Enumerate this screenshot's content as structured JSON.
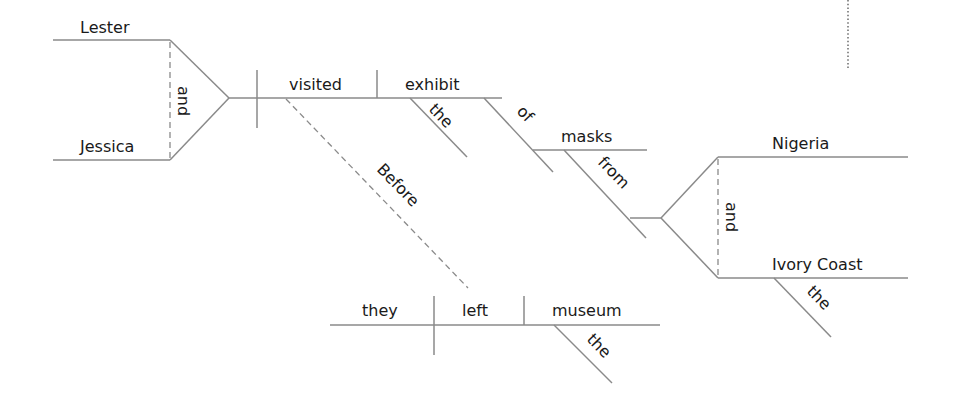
{
  "diagram": {
    "type": "Reed-Kellogg sentence diagram",
    "sentence_words": {
      "subject_1": "Lester",
      "subject_2": "Jessica",
      "subject_conjunction": "and",
      "verb": "visited",
      "direct_object": "exhibit",
      "object_article": "the",
      "preposition_1": "of",
      "prep_object_1": "masks",
      "preposition_2": "from",
      "prep_object_2a": "Nigeria",
      "prep_object_2b": "Ivory Coast",
      "prep_object_conjunction": "and",
      "prep_object_2b_article": "the",
      "subordinating_conjunction": "Before",
      "clause_subject": "they",
      "clause_verb": "left",
      "clause_object": "museum",
      "clause_object_article": "the"
    },
    "line_color": "#8a8a8a",
    "text_color": "#1a1a1a"
  }
}
